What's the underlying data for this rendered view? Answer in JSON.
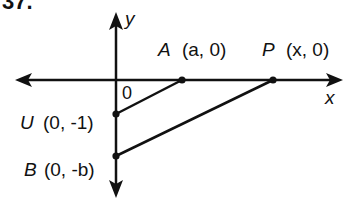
{
  "problem": {
    "number": "37."
  },
  "axes": {
    "x_label": "x",
    "y_label": "y",
    "origin_label": "0"
  },
  "points": {
    "A": {
      "name": "A",
      "coords": "(a, 0)"
    },
    "P": {
      "name": "P",
      "coords": "(x, 0)"
    },
    "U": {
      "name": "U",
      "coords": "(0, -1)"
    },
    "B": {
      "name": "B",
      "coords": "(0, -b)"
    }
  },
  "segments": [
    "UA",
    "BP"
  ],
  "colors": {
    "ink": "#111111",
    "background": "#ffffff"
  }
}
